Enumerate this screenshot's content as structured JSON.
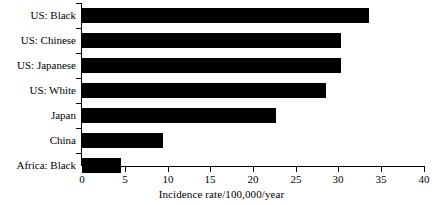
{
  "chart_data": {
    "type": "bar",
    "orientation": "horizontal",
    "title": "",
    "subtitle": "",
    "xlabel": "Incidence rate/100,000/year",
    "ylabel": "",
    "xlim": [
      0,
      40
    ],
    "xticks": [
      0,
      5,
      10,
      15,
      20,
      25,
      30,
      35,
      40
    ],
    "xtick_labels": [
      "0",
      "5",
      "10",
      "15",
      "20",
      "25",
      "30",
      "35",
      "40"
    ],
    "grid": false,
    "legend": null,
    "bar_color": "#000000",
    "background_color": "#ffffff",
    "axis_color": "#000000",
    "categories": [
      "US: Black",
      "US: Chinese",
      "US: Japanese",
      "US: White",
      "Japan",
      "China",
      "Africa: Black"
    ],
    "values": [
      33.6,
      30.3,
      30.3,
      28.5,
      22.7,
      9.5,
      4.5
    ],
    "annotations": []
  }
}
